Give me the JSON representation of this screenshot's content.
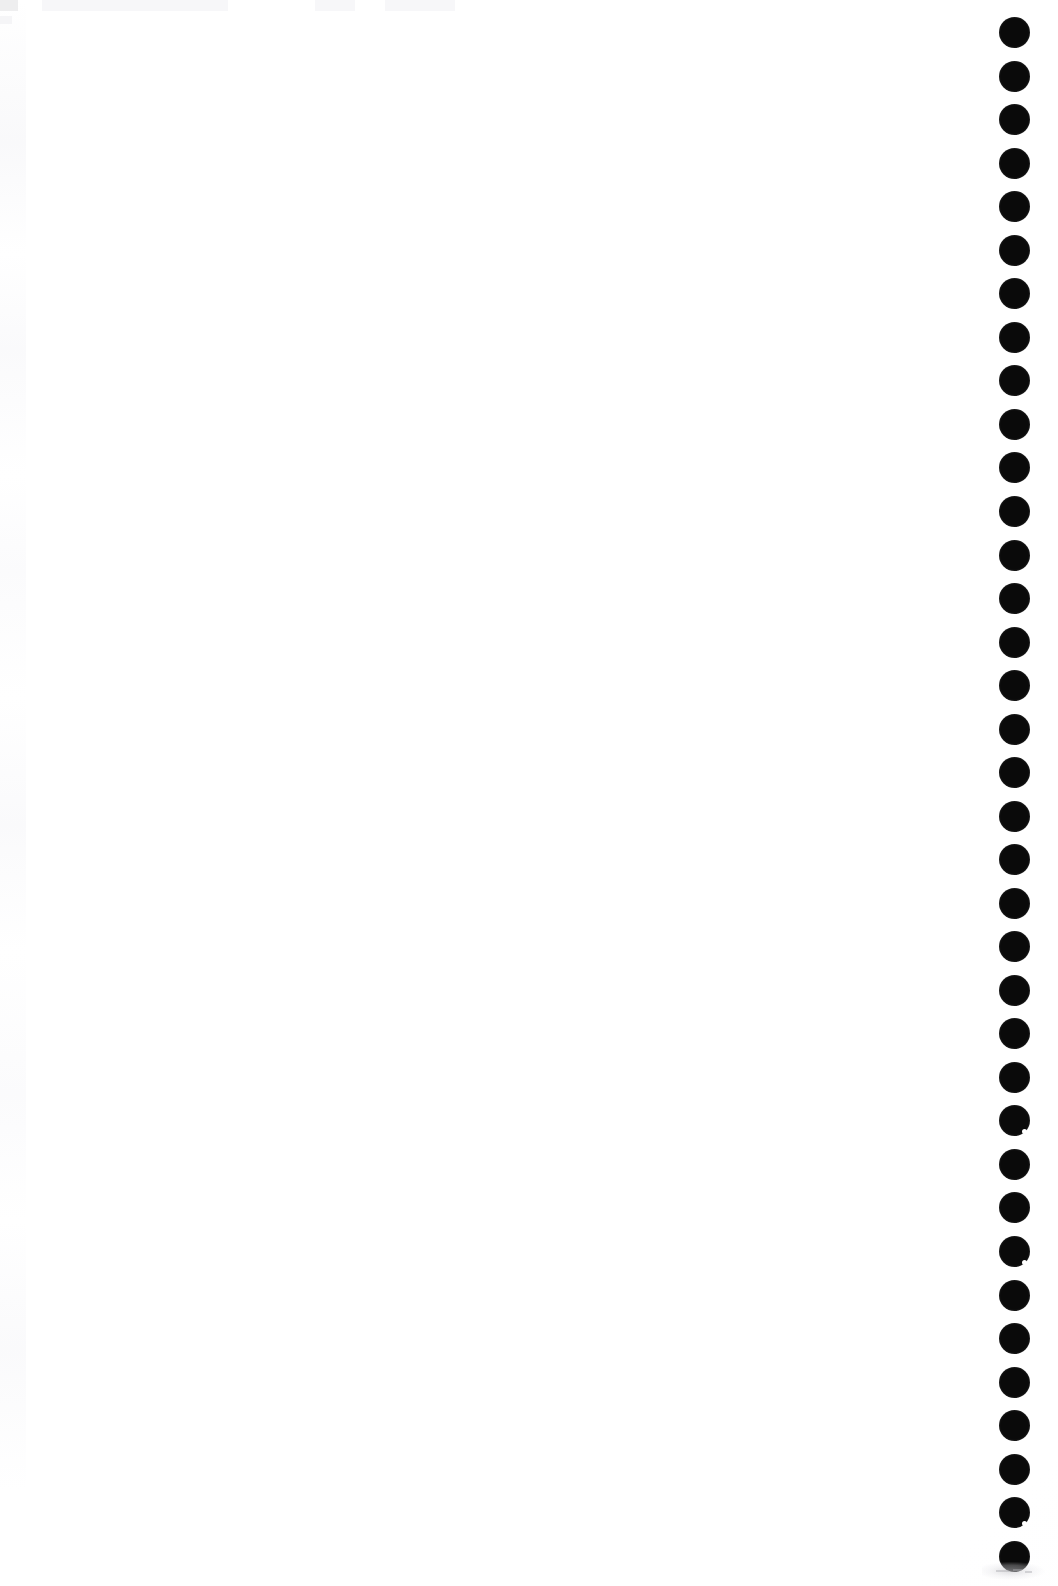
{
  "page": {
    "kind": "scanned-page",
    "width": 1058,
    "height": 1586,
    "background_color": "#ffffff",
    "content_text": "",
    "note": "Blank scanned sheet; no printed text, figures or captions are legible."
  },
  "binding": {
    "name": "punch-hole-column",
    "edge": "right",
    "hole_count": 36,
    "hole_color": "#0a0a0a",
    "hole_diameter_px": 31,
    "center_x_px": 1014,
    "first_center_y_px": 32,
    "spacing_px": 43.55,
    "last_center_y_px": 1556,
    "holes": [
      {
        "index": 1,
        "center_y": 32
      },
      {
        "index": 2,
        "center_y": 76
      },
      {
        "index": 3,
        "center_y": 119
      },
      {
        "index": 4,
        "center_y": 163
      },
      {
        "index": 5,
        "center_y": 206
      },
      {
        "index": 6,
        "center_y": 250
      },
      {
        "index": 7,
        "center_y": 293
      },
      {
        "index": 8,
        "center_y": 337
      },
      {
        "index": 9,
        "center_y": 380
      },
      {
        "index": 10,
        "center_y": 424
      },
      {
        "index": 11,
        "center_y": 467
      },
      {
        "index": 12,
        "center_y": 511
      },
      {
        "index": 13,
        "center_y": 555
      },
      {
        "index": 14,
        "center_y": 598
      },
      {
        "index": 15,
        "center_y": 642
      },
      {
        "index": 16,
        "center_y": 685
      },
      {
        "index": 17,
        "center_y": 729
      },
      {
        "index": 18,
        "center_y": 772
      },
      {
        "index": 19,
        "center_y": 816
      },
      {
        "index": 20,
        "center_y": 859
      },
      {
        "index": 21,
        "center_y": 903
      },
      {
        "index": 22,
        "center_y": 946
      },
      {
        "index": 23,
        "center_y": 990
      },
      {
        "index": 24,
        "center_y": 1033
      },
      {
        "index": 25,
        "center_y": 1077
      },
      {
        "index": 26,
        "center_y": 1120
      },
      {
        "index": 27,
        "center_y": 1164
      },
      {
        "index": 28,
        "center_y": 1207
      },
      {
        "index": 29,
        "center_y": 1251
      },
      {
        "index": 30,
        "center_y": 1295
      },
      {
        "index": 31,
        "center_y": 1338
      },
      {
        "index": 32,
        "center_y": 1382
      },
      {
        "index": 33,
        "center_y": 1425
      },
      {
        "index": 34,
        "center_y": 1469
      },
      {
        "index": 35,
        "center_y": 1512
      },
      {
        "index": 36,
        "center_y": 1556
      }
    ],
    "nicked_hole_indices": [
      26,
      29,
      35
    ]
  },
  "artifacts": {
    "ghost_header_present": true,
    "scan_noise_left_edge_present": true,
    "bottom_right_smudge_present": true
  }
}
